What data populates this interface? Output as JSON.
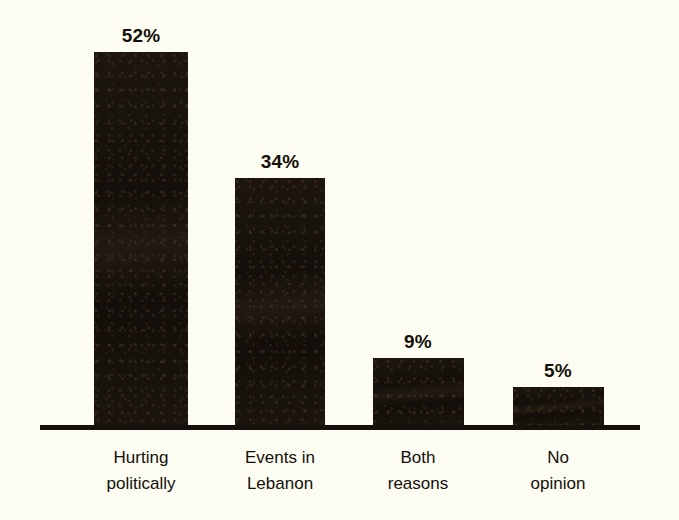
{
  "chart_data": {
    "type": "bar",
    "title": "",
    "subtitle": "",
    "xlabel": "",
    "ylabel": "",
    "ylim": [
      0,
      60
    ],
    "grid": false,
    "legend": "none",
    "orientation": "vertical",
    "value_suffix": "%",
    "categories": [
      "Hurting politically",
      "Events in Lebanon",
      "Both reasons",
      "No opinion"
    ],
    "category_lines": [
      [
        "Hurting",
        "politically"
      ],
      [
        "Events in",
        "Lebanon"
      ],
      [
        "Both",
        "reasons"
      ],
      [
        "No",
        "opinion"
      ]
    ],
    "values": [
      52,
      34,
      9,
      5
    ],
    "value_labels": [
      "52%",
      "34%",
      "9%",
      "5%"
    ],
    "bars": [
      {
        "category": "Hurting politically",
        "line1": "Hurting",
        "line2": "politically",
        "value": 52,
        "value_label": "52%"
      },
      {
        "category": "Events in Lebanon",
        "line1": "Events in",
        "line2": "Lebanon",
        "value": 34,
        "value_label": "34%"
      },
      {
        "category": "Both reasons",
        "line1": "Both",
        "line2": "reasons",
        "value": 9,
        "value_label": "9%"
      },
      {
        "category": "No opinion",
        "line1": "No",
        "line2": "opinion",
        "value": 5,
        "value_label": "5%"
      }
    ]
  },
  "style": {
    "background_color": "#fdfcf2",
    "bar_color": "#1a140f",
    "axis_color": "#15110c",
    "text_color": "#141009"
  },
  "geometry": {
    "axis": {
      "x": 40,
      "y": 425,
      "width": 600,
      "height": 5
    },
    "bars": [
      {
        "x": 94,
        "top": 52,
        "width": 94,
        "height": 373
      },
      {
        "x": 235,
        "top": 178,
        "width": 90,
        "height": 247
      },
      {
        "x": 373,
        "top": 358,
        "width": 91,
        "height": 67
      },
      {
        "x": 513,
        "top": 387,
        "width": 91,
        "height": 38
      }
    ],
    "value_labels": [
      {
        "center_x": 141,
        "baseline_y": 42
      },
      {
        "center_x": 280,
        "baseline_y": 168
      },
      {
        "center_x": 418,
        "baseline_y": 348
      },
      {
        "center_x": 558,
        "baseline_y": 377
      }
    ],
    "category_labels": [
      {
        "center_x": 141,
        "top": 445
      },
      {
        "center_x": 280,
        "top": 445
      },
      {
        "center_x": 418,
        "top": 445
      },
      {
        "center_x": 558,
        "top": 445
      }
    ]
  }
}
